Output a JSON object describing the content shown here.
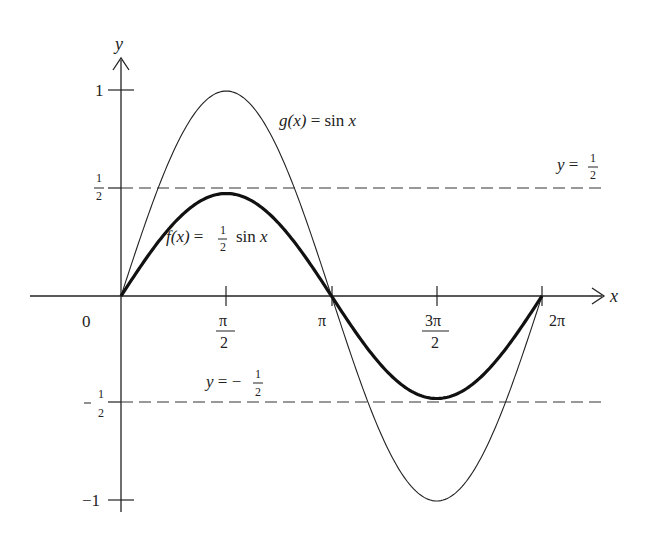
{
  "chart_data": {
    "type": "line",
    "title": "",
    "xlabel": "x",
    "ylabel": "y",
    "x_ticks": [
      "0",
      "π/2",
      "π",
      "3π/2",
      "2π"
    ],
    "x_tick_values": [
      0,
      1.5708,
      3.1416,
      4.7124,
      6.2832
    ],
    "y_ticks": [
      "1",
      "1/2",
      "-1/2",
      "-1"
    ],
    "y_tick_values": [
      1,
      0.5,
      -0.5,
      -1
    ],
    "xlim": [
      0,
      6.2832
    ],
    "ylim": [
      -1,
      1
    ],
    "grid": false,
    "series": [
      {
        "name": "g(x) = sin x",
        "style": "thin",
        "x": [
          0,
          0.7854,
          1.5708,
          2.3562,
          3.1416,
          3.927,
          4.7124,
          5.4978,
          6.2832
        ],
        "values": [
          0,
          0.707,
          1,
          0.707,
          0,
          -0.707,
          -1,
          -0.707,
          0
        ]
      },
      {
        "name": "f(x) = 1/2 sin x",
        "style": "thick",
        "x": [
          0,
          0.7854,
          1.5708,
          2.3562,
          3.1416,
          3.927,
          4.7124,
          5.4978,
          6.2832
        ],
        "values": [
          0,
          0.354,
          0.5,
          0.354,
          0,
          -0.354,
          -0.5,
          -0.354,
          0
        ]
      }
    ],
    "reference_lines": [
      {
        "label": "y = 1/2",
        "y": 0.5,
        "style": "dashed"
      },
      {
        "label": "y = -1/2",
        "y": -0.5,
        "style": "dashed"
      }
    ],
    "annotations": [
      "g(x) = sin x",
      "f(x) = 1/2 sin x",
      "y = 1/2",
      "y = -1/2"
    ]
  },
  "labels": {
    "x_axis": "x",
    "y_axis": "y",
    "origin": "0",
    "pi_half_num": "π",
    "pi_half_den": "2",
    "pi": "π",
    "three_pi_half_num": "3π",
    "three_pi_half_den": "2",
    "two_pi": "2π",
    "y_one": "1",
    "y_half_num": "1",
    "y_half_den": "2",
    "y_neg_half_sign": "−",
    "y_neg_half_num": "1",
    "y_neg_half_den": "2",
    "y_neg_one": "−1",
    "g_label_fn": "g(x)",
    "g_label_eq": " = sin ",
    "g_label_x": "x",
    "f_label_fn": "f(x)",
    "f_label_eq": " = ",
    "f_label_num": "1",
    "f_label_den": "2",
    "f_label_sin": "sin ",
    "f_label_x": "x",
    "ref_top_y": "y",
    "ref_top_eq": " = ",
    "ref_top_num": "1",
    "ref_top_den": "2",
    "ref_bot_y": "y",
    "ref_bot_eq": " = −",
    "ref_bot_num": "1",
    "ref_bot_den": "2"
  }
}
